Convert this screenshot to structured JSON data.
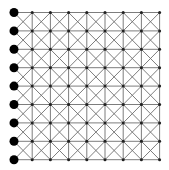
{
  "diagram": {
    "type": "lattice-grid",
    "columns": 9,
    "rows": 9,
    "origin": {
      "x": 14,
      "y": 12.5
    },
    "spacing": {
      "x": 18.2,
      "y": 18.4
    },
    "cell_diagonals": true,
    "vertical_lines_skip_first_column": true,
    "large_nodes": {
      "column": 0,
      "radius": 4.5,
      "color": "#000000"
    },
    "small_nodes": {
      "radius": 1.5,
      "color": "#222222"
    },
    "line_color": "#6e6e6e",
    "line_width": 0.9
  }
}
